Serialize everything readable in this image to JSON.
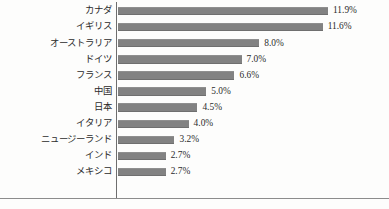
{
  "chart_data": {
    "type": "bar",
    "orientation": "horizontal",
    "title": "",
    "xlabel": "",
    "ylabel": "",
    "grid": false,
    "legend": null,
    "xlim": [
      0,
      11.9
    ],
    "value_suffix": "%",
    "categories": [
      "カナダ",
      "イギリス",
      "オーストラリア",
      "ドイツ",
      "フランス",
      "中国",
      "日本",
      "イタリア",
      "ニュージーランド",
      "インド",
      "メキシコ"
    ],
    "values": [
      11.9,
      11.6,
      8.0,
      7.0,
      6.6,
      5.0,
      4.5,
      4.0,
      3.2,
      2.7,
      2.7
    ],
    "value_labels": [
      "11.9%",
      "11.6%",
      "8.0%",
      "7.0%",
      "6.6%",
      "5.0%",
      "4.5%",
      "4.0%",
      "3.2%",
      "2.7%",
      "2.7%"
    ],
    "colors": {
      "bar": "#828282",
      "axis": "#6e6e6e",
      "text": "#2b2b2b",
      "background": "#fdfdfc"
    },
    "px_per_unit": 17.65
  },
  "caption": {
    "clipped_text": ""
  }
}
